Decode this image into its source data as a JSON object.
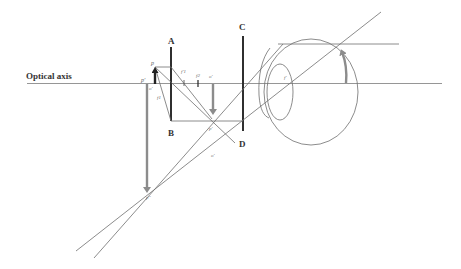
{
  "diagram": {
    "labels": {
      "optical_axis": "Optical axis",
      "lens_A": "A",
      "lens_B": "B",
      "lens_C": "C",
      "lens_D": "D",
      "p_top": "p",
      "p_prime_left": "p'",
      "o_small": "o'",
      "f1": "f1",
      "f1_prime": "f'1",
      "f2": "f2",
      "o_prime_top": "o'",
      "p_prime_mid": "p'",
      "o_prime_bottom": "o'",
      "p_double_prime": "p''",
      "f_eye": "f'"
    },
    "colors": {
      "axis": "#8a8a8a",
      "ray": "#6e6e6e",
      "lens": "#2f2f2f",
      "image_arrow": "#8c8c8c",
      "object_arrow": "#222222",
      "label": "#333333"
    }
  }
}
